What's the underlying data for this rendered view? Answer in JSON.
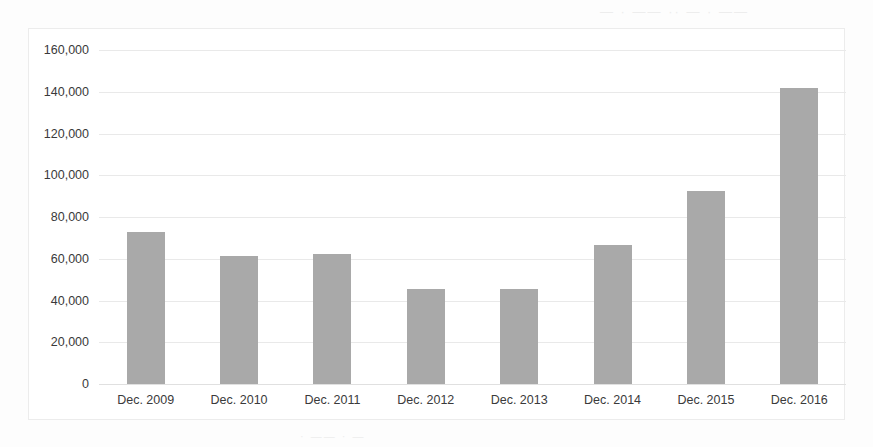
{
  "chart_data": {
    "type": "bar",
    "title": "",
    "subtitle": "",
    "xlabel": "",
    "ylabel": "",
    "categories": [
      "Dec. 2009",
      "Dec. 2010",
      "Dec. 2011",
      "Dec. 2012",
      "Dec. 2013",
      "Dec. 2014",
      "Dec. 2015",
      "Dec. 2016"
    ],
    "values": [
      73000,
      61500,
      62500,
      45500,
      45500,
      66500,
      92500,
      142000
    ],
    "series": [
      {
        "name": "",
        "values": [
          73000,
          61500,
          62500,
          45500,
          45500,
          66500,
          92500,
          142000
        ]
      }
    ],
    "ylim": [
      0,
      160000
    ],
    "ytick_values": [
      0,
      20000,
      40000,
      60000,
      80000,
      100000,
      120000,
      140000,
      160000
    ],
    "ytick_labels": [
      "160,000",
      "140,000",
      "120,000",
      "100,000",
      "80,000",
      "60,000",
      "40,000",
      "20,000",
      "0"
    ],
    "grid": true,
    "grid_axis": "y",
    "legend": false,
    "legend_position": "none",
    "bar_color": "#a9a9a9",
    "gridline_color": "#e9e9e9",
    "frame_color": "#ececec",
    "text_color": "#3a3a3a",
    "background_color": "#ffffff"
  },
  "artifacts": {
    "bleed_top": "— · —— ·· — · ——",
    "bleed_mid": "· — ·· —",
    "bleed_low": "— · —·",
    "bleed_bottom": "· —— · —"
  }
}
